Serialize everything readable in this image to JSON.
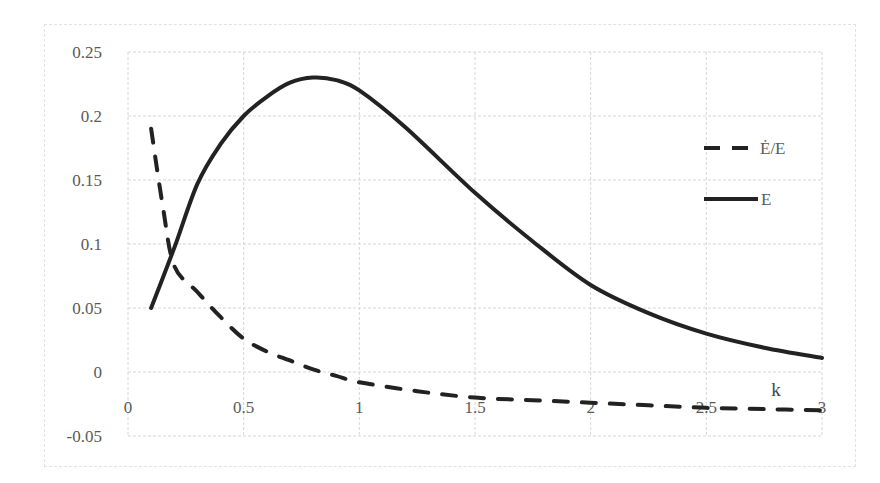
{
  "chart_data": {
    "type": "line",
    "title": "",
    "xlabel": "k",
    "ylabel": "",
    "xlim": [
      0,
      3
    ],
    "ylim": [
      -0.05,
      0.25
    ],
    "grid": true,
    "legend_position": "right",
    "x_ticks": [
      "0",
      "0.5",
      "1",
      "1.5",
      "2",
      "2.5",
      "3"
    ],
    "y_ticks": [
      "0.25",
      "0.2",
      "0.15",
      "0.1",
      "0.05",
      "0",
      "-0.05"
    ],
    "series": [
      {
        "name": "Ė/E",
        "style": "dashed",
        "color": "#222222",
        "x": [
          0.1,
          0.15,
          0.2,
          0.3,
          0.4,
          0.5,
          0.6,
          0.7,
          0.8,
          0.9,
          1.0,
          1.25,
          1.5,
          1.75,
          2.0,
          2.25,
          2.5,
          2.75,
          3.0
        ],
        "y": [
          0.19,
          0.13,
          0.083,
          0.0625,
          0.043,
          0.026,
          0.016,
          0.009,
          0.002,
          -0.003,
          -0.008,
          -0.015,
          -0.02,
          -0.022,
          -0.024,
          -0.026,
          -0.028,
          -0.029,
          -0.03
        ]
      },
      {
        "name": "E",
        "style": "solid",
        "color": "#222222",
        "x": [
          0.1,
          0.2,
          0.3,
          0.4,
          0.5,
          0.6,
          0.7,
          0.8,
          0.9,
          1.0,
          1.2,
          1.5,
          1.75,
          2.0,
          2.25,
          2.5,
          2.75,
          3.0
        ],
        "y": [
          0.05,
          0.097,
          0.147,
          0.178,
          0.2,
          0.215,
          0.226,
          0.23,
          0.228,
          0.22,
          0.191,
          0.14,
          0.102,
          0.068,
          0.046,
          0.03,
          0.019,
          0.011
        ]
      }
    ]
  },
  "legend": {
    "items": [
      {
        "label": "Ė/E",
        "style": "dashed"
      },
      {
        "label": "E",
        "style": "solid"
      }
    ]
  },
  "axis": {
    "x_title": "k"
  }
}
